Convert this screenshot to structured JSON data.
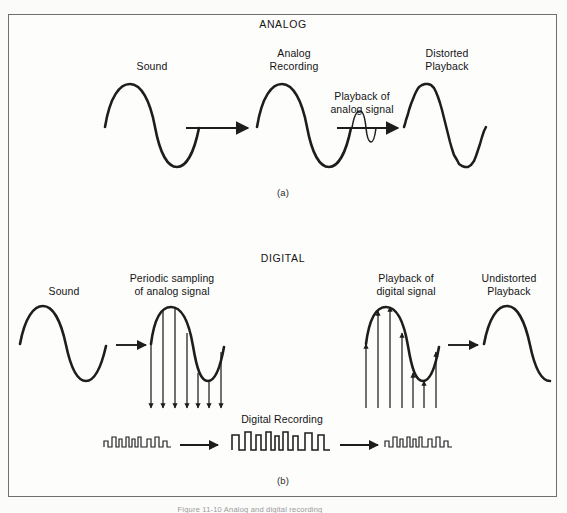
{
  "figure": {
    "caption": "Figure 11-10  Analog and digital recording",
    "frame_color": "#6e6f71",
    "ink_color": "#1d1d1d",
    "background": "#fdfdfc"
  },
  "panel_a": {
    "section_title": "ANALOG",
    "panel_id": "(a)",
    "labels": {
      "sound": "Sound",
      "analog_recording": "Analog\nRecording",
      "playback_of_analog_signal": "Playback of\nanalog signal",
      "distorted_playback": "Distorted\nPlayback"
    },
    "stages": [
      {
        "name": "sound",
        "waveform": "sine",
        "quality": "clean"
      },
      {
        "name": "analog-recording",
        "waveform": "sine",
        "quality": "clean"
      },
      {
        "name": "distorted-playback",
        "waveform": "sine",
        "quality": "noisy"
      }
    ]
  },
  "panel_b": {
    "section_title": "DIGITAL",
    "panel_id": "(b)",
    "labels": {
      "sound": "Sound",
      "periodic_sampling": "Periodic sampling\nof analog signal",
      "playback_of_digital_signal": "Playback of\ndigital signal",
      "undistorted_playback": "Undistorted\nPlayback",
      "digital_recording": "Digital Recording"
    },
    "sampling": {
      "arrow_count": 7,
      "direction": "down"
    },
    "reconstruction": {
      "arrow_count": 7,
      "direction": "up"
    },
    "pulse_trains": [
      {
        "name": "sampled-pulses-left",
        "size": "small"
      },
      {
        "name": "digital-recording-pulses",
        "size": "large"
      },
      {
        "name": "readout-pulses-right",
        "size": "small"
      }
    ],
    "stages": [
      {
        "name": "sound",
        "waveform": "sine",
        "quality": "clean"
      },
      {
        "name": "sampled-analog",
        "waveform": "sine",
        "quality": "clean"
      },
      {
        "name": "reconstructed-analog",
        "waveform": "sine",
        "quality": "clean"
      },
      {
        "name": "undistorted-playback",
        "waveform": "sine",
        "quality": "clean"
      }
    ]
  }
}
